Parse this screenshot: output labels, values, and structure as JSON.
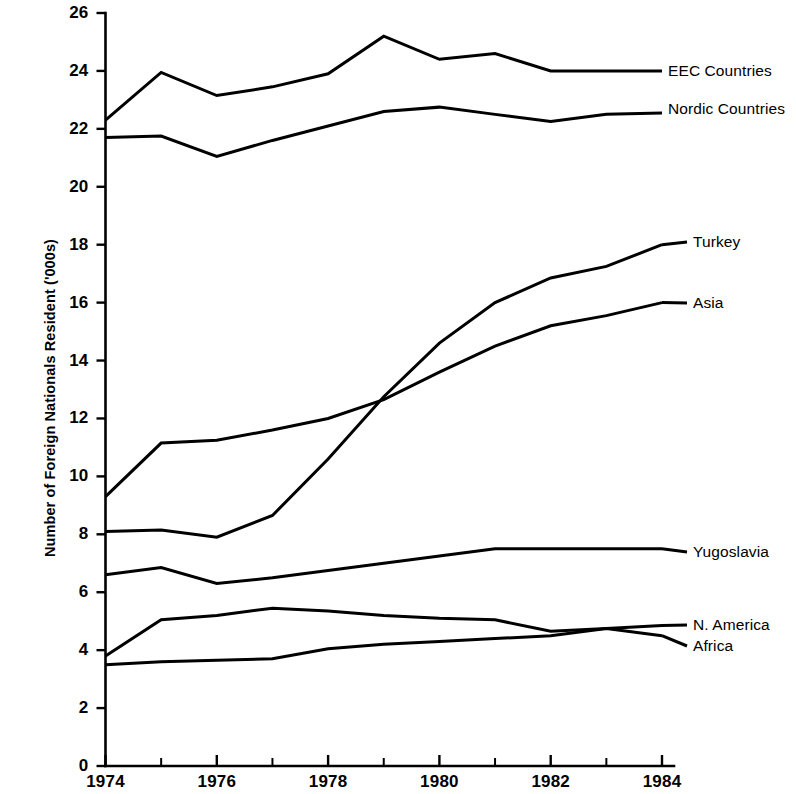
{
  "chart_data": {
    "type": "line",
    "title": "",
    "subtitle": "",
    "xlabel": "",
    "ylabel": "Number of Foreign Nationals Resident ('000s)",
    "x": [
      1974,
      1975,
      1976,
      1977,
      1978,
      1979,
      1980,
      1981,
      1982,
      1983,
      1984
    ],
    "xlim": [
      1974,
      1984
    ],
    "ylim": [
      0,
      26
    ],
    "x_tick_labels": [
      "1974",
      "1976",
      "1978",
      "1980",
      "1982",
      "1984"
    ],
    "x_tick_values": [
      1974,
      1976,
      1978,
      1980,
      1982,
      1984
    ],
    "x_minor_ticks": [
      1975,
      1977,
      1979,
      1981,
      1983
    ],
    "y_tick_labels": [
      "0",
      "2",
      "4",
      "6",
      "8",
      "10",
      "12",
      "14",
      "16",
      "18",
      "20",
      "22",
      "24",
      "26"
    ],
    "y_tick_values": [
      0,
      2,
      4,
      6,
      8,
      10,
      12,
      14,
      16,
      18,
      20,
      22,
      24,
      26
    ],
    "grid": false,
    "legend_position": "right-inline-labels",
    "line_color": "#000000",
    "series": [
      {
        "name": "EEC Countries",
        "label": "EEC Countries",
        "values": [
          22.3,
          23.95,
          23.15,
          23.45,
          23.9,
          25.2,
          24.4,
          24.6,
          24.0,
          24.0,
          24.0
        ]
      },
      {
        "name": "Nordic Countries",
        "label": "Nordic Countries",
        "values": [
          21.7,
          21.75,
          21.05,
          21.6,
          22.1,
          22.6,
          22.75,
          22.5,
          22.25,
          22.5,
          22.55
        ]
      },
      {
        "name": "Turkey",
        "label": "Turkey",
        "values": [
          8.1,
          8.15,
          7.9,
          8.65,
          10.6,
          12.75,
          14.6,
          16.0,
          16.85,
          17.25,
          18.0
        ]
      },
      {
        "name": "Asia",
        "label": "Asia",
        "values": [
          9.3,
          11.15,
          11.25,
          11.6,
          12.0,
          12.65,
          13.6,
          14.5,
          15.2,
          15.55,
          16.0
        ]
      },
      {
        "name": "Yugoslavia",
        "label": "Yugoslavia",
        "values": [
          6.6,
          6.85,
          6.3,
          6.5,
          6.75,
          7.0,
          7.25,
          7.5,
          7.5,
          7.5,
          7.5
        ]
      },
      {
        "name": "N. America",
        "label": "N. America",
        "values": [
          3.8,
          5.05,
          5.2,
          5.45,
          5.35,
          5.2,
          5.1,
          5.05,
          4.65,
          4.75,
          4.85
        ]
      },
      {
        "name": "Africa",
        "label": "Africa",
        "values": [
          3.5,
          3.6,
          3.65,
          3.7,
          4.05,
          4.2,
          4.3,
          4.4,
          4.5,
          4.75,
          4.5
        ]
      }
    ]
  }
}
